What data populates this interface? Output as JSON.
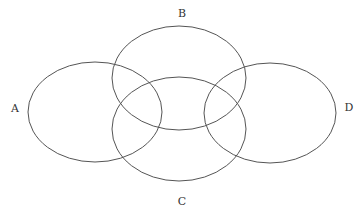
{
  "diagram": {
    "type": "venn",
    "stroke_color": "#555555",
    "label_color": "#333333",
    "background": "#ffffff",
    "sets": [
      {
        "id": "A",
        "label": "A",
        "cx": 95,
        "cy": 112,
        "rx": 67,
        "ry": 50,
        "label_x": 15,
        "label_y": 112
      },
      {
        "id": "B",
        "label": "B",
        "cx": 179,
        "cy": 78,
        "rx": 67,
        "ry": 52,
        "label_x": 182,
        "label_y": 17
      },
      {
        "id": "C",
        "label": "C",
        "cx": 179,
        "cy": 129,
        "rx": 67,
        "ry": 52,
        "label_x": 182,
        "label_y": 205
      },
      {
        "id": "D",
        "label": "D",
        "cx": 270,
        "cy": 113,
        "rx": 66,
        "ry": 50,
        "label_x": 349,
        "label_y": 111
      }
    ]
  }
}
